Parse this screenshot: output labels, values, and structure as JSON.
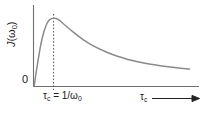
{
  "figure": {
    "origin_label": "0",
    "y_axis_label_main": "J",
    "y_axis_label_arg": "(ω",
    "y_axis_label_sub": "0",
    "y_axis_label_close": ")",
    "y_axis_label_full": "J(ω₀)",
    "x_tick_label": "τ",
    "x_tick_sub": "c",
    "x_tick_rest": " = 1/ω",
    "x_tick_rest_sub": "0",
    "x_tick_full": "τc = 1/ω0",
    "x_axis_label": "τ",
    "x_axis_label_sub": "c",
    "x_axis_label_full": "τc",
    "curve_color": "#8a8a8a",
    "axis_color": "#6f6f6f",
    "dash_color": "#545454",
    "arrow_color": "#222222",
    "background": "#ffffff"
  },
  "chart_data": {
    "type": "line",
    "title": "",
    "xlabel": "τc",
    "ylabel": "J(ω₀)",
    "grid": false,
    "legend": false,
    "annotations": [
      {
        "text": "τc = 1/ω0",
        "x": 1.0,
        "kind": "vertical-dashed-line-at-maximum"
      },
      {
        "text": "0",
        "x": 0.0,
        "y": 0.0,
        "kind": "origin-label"
      }
    ],
    "xlim": [
      0,
      8
    ],
    "ylim": [
      0,
      1.12
    ],
    "x_tick_values": [
      1.0
    ],
    "x_tick_labels": [
      "τc = 1/ω0"
    ],
    "y_tick_values": [
      0
    ],
    "y_tick_labels": [
      "0"
    ],
    "series": [
      {
        "name": "J(ω₀)",
        "color": "#8a8a8a",
        "x": [
          0.0,
          0.05,
          0.1,
          0.15,
          0.2,
          0.3,
          0.4,
          0.5,
          0.65,
          0.8,
          1.0,
          1.25,
          1.5,
          2.0,
          2.5,
          3.0,
          3.5,
          4.0,
          5.0,
          6.0,
          7.0,
          8.0
        ],
        "y": [
          0.0,
          0.1,
          0.2,
          0.29,
          0.38,
          0.55,
          0.69,
          0.8,
          0.92,
          0.98,
          1.0,
          0.98,
          0.92,
          0.8,
          0.69,
          0.6,
          0.53,
          0.47,
          0.38,
          0.32,
          0.28,
          0.25
        ]
      }
    ]
  }
}
